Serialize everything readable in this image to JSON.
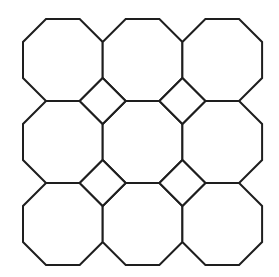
{
  "diagram": {
    "background": "#ffffff",
    "stroke_color": "#1e1e1e",
    "stroke_width": 2,
    "grid": {
      "rows": 3,
      "cols": 3,
      "origin_x": 23,
      "origin_y": 19,
      "cell_width": 79.7,
      "cell_height": 82,
      "cut_x": 23,
      "cut_y": 23
    },
    "octagons": [
      {
        "row": 0,
        "col": 0
      },
      {
        "row": 0,
        "col": 1
      },
      {
        "row": 0,
        "col": 2
      },
      {
        "row": 1,
        "col": 0
      },
      {
        "row": 1,
        "col": 1
      },
      {
        "row": 1,
        "col": 2
      },
      {
        "row": 2,
        "col": 0
      },
      {
        "row": 2,
        "col": 1
      },
      {
        "row": 2,
        "col": 2
      }
    ],
    "squares": [
      {
        "between_row": 1,
        "between_col": 1
      },
      {
        "between_row": 1,
        "between_col": 2
      },
      {
        "between_row": 2,
        "between_col": 1
      },
      {
        "between_row": 2,
        "between_col": 2
      }
    ]
  }
}
